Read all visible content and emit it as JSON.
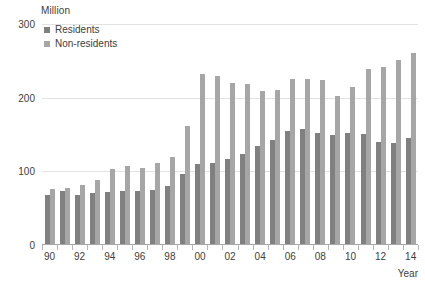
{
  "chart_data": {
    "type": "bar",
    "title": "",
    "subtitle": "",
    "unit_label": "Million",
    "xlabel": "Year",
    "ylabel": "",
    "ylim": [
      0,
      300
    ],
    "y_ticks": [
      0,
      100,
      200,
      300
    ],
    "grid": true,
    "legend_position": "top-left",
    "categories": [
      "90",
      "91",
      "92",
      "93",
      "94",
      "95",
      "96",
      "97",
      "98",
      "99",
      "00",
      "01",
      "02",
      "03",
      "04",
      "05",
      "06",
      "07",
      "08",
      "09",
      "10",
      "11",
      "12",
      "13",
      "14"
    ],
    "tick_labels": [
      "90",
      "",
      "92",
      "",
      "94",
      "",
      "96",
      "",
      "98",
      "",
      "00",
      "",
      "02",
      "",
      "04",
      "",
      "06",
      "",
      "08",
      "",
      "10",
      "",
      "12",
      "",
      "14"
    ],
    "series": [
      {
        "name": "Residents",
        "color": "#808080",
        "values": [
          68,
          73,
          68,
          70,
          72,
          74,
          73,
          75,
          80,
          97,
          110,
          112,
          117,
          124,
          134,
          143,
          155,
          158,
          152,
          149,
          152,
          151,
          140,
          138,
          145
        ]
      },
      {
        "name": "Non-residents",
        "color": "#a6a6a6",
        "values": [
          76,
          78,
          81,
          88,
          103,
          107,
          105,
          112,
          120,
          161,
          232,
          230,
          220,
          218,
          209,
          210,
          225,
          226,
          224,
          202,
          214,
          239,
          242,
          251,
          261
        ]
      }
    ]
  },
  "legend": {
    "items": [
      {
        "label": "Residents",
        "color": "#808080"
      },
      {
        "label": "Non-residents",
        "color": "#a6a6a6"
      }
    ]
  },
  "axes": {
    "unit_label": "Million",
    "x_title": "Year",
    "y_ticks": [
      "300",
      "200",
      "100",
      "0"
    ]
  }
}
